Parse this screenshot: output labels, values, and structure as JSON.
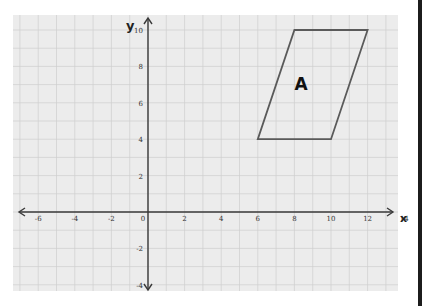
{
  "diagram": {
    "type": "coordinate-grid",
    "axes": {
      "x_label": "x",
      "y_label": "y",
      "x_ticks": [
        "-6",
        "-4",
        "-2",
        "0",
        "2",
        "4",
        "6",
        "8",
        "10",
        "12",
        "14"
      ],
      "y_ticks": [
        "10",
        "8",
        "6",
        "4",
        "2",
        "-2",
        "-4"
      ],
      "x_range": [
        -7,
        14
      ],
      "y_range": [
        -4.5,
        10
      ],
      "grid": true
    },
    "shapes": [
      {
        "name": "A",
        "type": "parallelogram",
        "vertices": [
          [
            6,
            4
          ],
          [
            10,
            4
          ],
          [
            12,
            10
          ],
          [
            8,
            10
          ]
        ],
        "stroke_color": "#5a5a5a"
      }
    ],
    "colors": {
      "paper": "#ececec",
      "grid": "#c9c9c9",
      "axis": "#3a3a3a"
    }
  }
}
